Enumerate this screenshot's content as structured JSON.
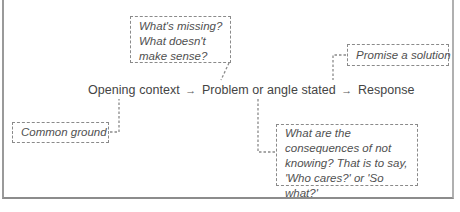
{
  "diagram": {
    "flow": {
      "steps": [
        {
          "label": "Opening context"
        },
        {
          "label": "Problem or angle stated"
        },
        {
          "label": "Response"
        }
      ],
      "arrow_glyph": "→"
    },
    "notes": {
      "missing": {
        "lines": [
          "What's missing?",
          "What doesn't",
          "make sense?"
        ],
        "attached_to": "Problem or angle stated"
      },
      "solution": {
        "lines": [
          "Promise a solution"
        ],
        "attached_to": "Response"
      },
      "common_ground": {
        "lines": [
          "Common ground"
        ],
        "attached_to": "Opening context"
      },
      "consequences": {
        "lines": [
          "What are the",
          "consequences of not",
          "knowing? That is to say,",
          "'Who cares?' or 'So what?'"
        ],
        "attached_to": "Problem or angle stated"
      }
    },
    "colors": {
      "text": "#444444",
      "note_text": "#505050",
      "dash_border": "#8a8a8a",
      "frame_border": "#9a9a9a"
    }
  }
}
